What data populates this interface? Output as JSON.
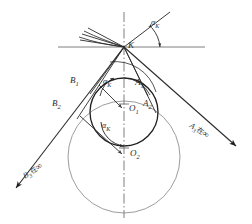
{
  "figure": {
    "background_color": "#ffffff",
    "stroke_dark": "#1f1f1f",
    "stroke_mid": "#4a4a4a",
    "stroke_light": "#9a9a9a",
    "stroke_axis": "#6b6b6b"
  },
  "points": [
    {
      "id": "K",
      "label": "K",
      "sub": "",
      "x": 124,
      "y": 47,
      "label_x": 128,
      "label_y": 45
    },
    {
      "id": "B1",
      "label": "B",
      "sub": "1",
      "x": 92,
      "y": 93,
      "label_x": 72,
      "label_y": 80
    },
    {
      "id": "B2",
      "label": "B",
      "sub": "2",
      "x": 78,
      "y": 118,
      "label_x": 55,
      "label_y": 103
    },
    {
      "id": "A1",
      "label": "A",
      "sub": "1",
      "x": 147,
      "y": 95,
      "label_x": 136,
      "label_y": 82
    },
    {
      "id": "A2",
      "label": "A",
      "sub": "2",
      "x": 155,
      "y": 112,
      "label_x": 143,
      "label_y": 103
    },
    {
      "id": "O1",
      "label": "O",
      "sub": "1",
      "x": 124,
      "y": 112,
      "label_x": 128,
      "label_y": 107
    },
    {
      "id": "O2",
      "label": "O",
      "sub": "2",
      "x": 124,
      "y": 157,
      "label_x": 129,
      "label_y": 152
    }
  ],
  "angles": [
    {
      "id": "alpha-k-top",
      "label": "α",
      "sub": "K",
      "label_x": 152,
      "label_y": 23
    },
    {
      "id": "alpha-k-upper",
      "label": "α",
      "sub": "K",
      "label_x": 105,
      "label_y": 82
    },
    {
      "id": "alpha-k-lower",
      "label": "α",
      "sub": "K",
      "label_x": 104,
      "label_y": 126
    }
  ],
  "ray_labels": [
    {
      "id": "a3-at-infinity",
      "point": "A",
      "sub": "3",
      "at_text": "在",
      "infinity": "∞",
      "x": 192,
      "y": 124,
      "rotate_deg": 33
    },
    {
      "id": "b3-at-infinity",
      "point": "B",
      "sub": "3",
      "at_text": "在",
      "infinity": "∞",
      "x": 26,
      "y": 176,
      "rotate_deg": -33
    }
  ],
  "circles": [
    {
      "id": "circle-small",
      "cx": 124,
      "cy": 112,
      "r": 34,
      "color": "#1f1f1f",
      "width": 1.25
    },
    {
      "id": "circle-large",
      "cx": 124,
      "cy": 157,
      "r": 56,
      "color": "#9a9a9a",
      "width": 1.0
    }
  ],
  "lines": {
    "horizontal_through_k": {
      "x1": 58,
      "y1": 47,
      "x2": 205,
      "y2": 47
    },
    "vertical_axis": {
      "x1": 124,
      "y1": 12,
      "x2": 124,
      "y2": 218
    }
  }
}
